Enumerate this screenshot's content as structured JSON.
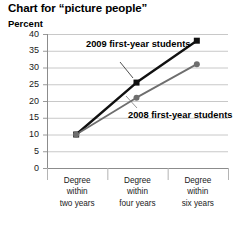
{
  "header": {
    "title": "Chart for “picture people”",
    "unit_label": "Percent"
  },
  "chart_data": {
    "type": "line",
    "title": "Chart for “picture people”",
    "xlabel": "",
    "ylabel": "Percent",
    "ylim": [
      0,
      40
    ],
    "yticks": [
      0,
      5,
      10,
      15,
      20,
      25,
      30,
      35,
      40
    ],
    "ytick_labels": [
      "0",
      "5",
      "10",
      "15",
      "20",
      "25",
      "30",
      "35",
      "40"
    ],
    "grid": true,
    "legend_position": "inline-annotations",
    "categories": [
      "Degree within two years",
      "Degree within four years",
      "Degree within six years"
    ],
    "category_lines": [
      [
        "Degree",
        "within",
        "two years"
      ],
      [
        "Degree",
        "within",
        "four years"
      ],
      [
        "Degree",
        "within",
        "six years"
      ]
    ],
    "series": [
      {
        "name": "2009 first-year students",
        "values": [
          10,
          25.5,
          38
        ],
        "color": "#111111",
        "marker": "square"
      },
      {
        "name": "2008 first-year students",
        "values": [
          10,
          21,
          31
        ],
        "color": "#6e6e6e",
        "marker": "circle"
      }
    ],
    "annotations": [
      {
        "text_lines": [
          "2009 first-year",
          "students"
        ],
        "series": "2009 first-year students"
      },
      {
        "text_lines": [
          "2008 first-year",
          "students"
        ],
        "series": "2008 first-year students"
      }
    ]
  }
}
